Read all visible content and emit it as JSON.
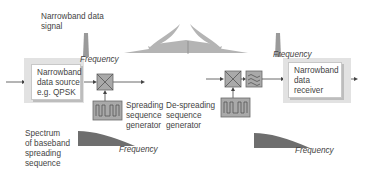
{
  "labels": {
    "narrowband_signal": "Narrowband data\nsignal",
    "source_box": "Narrowband\ndata source\ne.g. QPSK",
    "receiver_box": "Narrowband\ndata\nreceiver",
    "spreading_gen": "Spreading\nsequence\ngenerator",
    "despreading_gen": "De-spreading\nsequence\ngenerator",
    "spectrum_baseband": "Spectrum\nof baseband\nspreading\nsequence",
    "freq_top_left": "Frequency",
    "freq_top_right": "Frequency",
    "freq_bottom_left": "Frequency",
    "freq_bottom_right": "Frequency"
  },
  "colors": {
    "block_fill": "#a9a9a9",
    "panel": "#e2e2e2",
    "spectrum": "#6e6e6e",
    "wave": "#b4b4b4"
  }
}
